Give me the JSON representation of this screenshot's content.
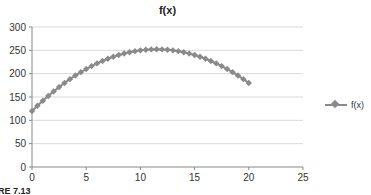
{
  "chart_data": {
    "type": "scatter",
    "title": "f(x)",
    "xlabel": "",
    "ylabel": "",
    "xlim": [
      0,
      25
    ],
    "ylim": [
      0,
      300
    ],
    "xticks": [
      0,
      5,
      10,
      15,
      20,
      25
    ],
    "yticks": [
      0,
      50,
      100,
      150,
      200,
      250,
      300
    ],
    "grid": {
      "horizontal": true,
      "vertical": false
    },
    "legend": {
      "position": "right",
      "entries": [
        "f(x)"
      ]
    },
    "marker": "diamond",
    "color": "#8a8a8a",
    "series": [
      {
        "name": "f(x)",
        "x": [
          0,
          0.5,
          1,
          1.5,
          2,
          2.5,
          3,
          3.5,
          4,
          4.5,
          5,
          5.5,
          6,
          6.5,
          7,
          7.5,
          8,
          8.5,
          9,
          9.5,
          10,
          10.5,
          11,
          11.5,
          12,
          12.5,
          13,
          13.5,
          14,
          14.5,
          15,
          15.5,
          16,
          16.5,
          17,
          17.5,
          18,
          18.5,
          19,
          19.5,
          20
        ],
        "y": [
          120,
          131.25,
          142,
          152.25,
          162,
          171.25,
          180,
          188.25,
          196,
          203.25,
          210,
          216.25,
          222,
          227.25,
          232,
          236.25,
          240,
          243.25,
          246,
          248.25,
          250,
          251.25,
          252,
          252.25,
          252,
          251.25,
          250,
          248.25,
          246,
          243.25,
          240,
          236.25,
          232,
          227.25,
          222,
          216.25,
          210,
          203.25,
          196,
          188.25,
          180
        ]
      }
    ]
  },
  "chart": {
    "title": "f(x)",
    "legend_label": "f(x)",
    "x_tick_labels": [
      "0",
      "5",
      "10",
      "15",
      "20",
      "25"
    ],
    "y_tick_labels": [
      "0",
      "50",
      "100",
      "150",
      "200",
      "250",
      "300"
    ]
  },
  "caption": "RE 7.13"
}
